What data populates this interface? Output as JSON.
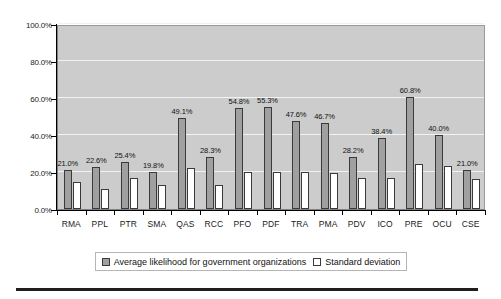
{
  "chart_data": {
    "type": "bar",
    "title": "",
    "xlabel": "",
    "ylabel": "",
    "ylim": [
      0,
      100
    ],
    "yticks": [
      "0.0%",
      "20.0%",
      "40.0%",
      "60.0%",
      "80.0%",
      "100.0%"
    ],
    "ytick_values": [
      0,
      20,
      40,
      60,
      80,
      100
    ],
    "grid": true,
    "legend_position": "bottom",
    "categories": [
      "RMA",
      "PPL",
      "PTR",
      "SMA",
      "QAS",
      "RCC",
      "PFO",
      "PDF",
      "TRA",
      "PMA",
      "PDV",
      "ICO",
      "PRE",
      "OCU",
      "CSE"
    ],
    "series": [
      {
        "name": "Average likelihood for government organizations",
        "color": "#a0a0a0",
        "values": [
          21.0,
          22.6,
          25.4,
          19.8,
          49.1,
          28.3,
          54.8,
          55.3,
          47.6,
          46.7,
          28.2,
          38.4,
          60.8,
          40.0,
          21.0
        ],
        "labels": [
          "21.0%",
          "22.6%",
          "25.4%",
          "19.8%",
          "49.1%",
          "28.3%",
          "54.8%",
          "55.3%",
          "47.6%",
          "46.7%",
          "28.2%",
          "38.4%",
          "60.8%",
          "40.0%",
          "21.0%"
        ]
      },
      {
        "name": "Standard deviation",
        "color": "#ffffff",
        "values": [
          14.6,
          10.8,
          16.5,
          12.8,
          22.0,
          12.8,
          19.8,
          19.8,
          19.8,
          19.5,
          17.0,
          17.0,
          24.6,
          23.0,
          16.3
        ],
        "labels": []
      }
    ]
  },
  "legend": {
    "items": [
      {
        "label": "Average likelihood for government organizations",
        "swatch": "main"
      },
      {
        "label": "Standard deviation",
        "swatch": "sd"
      }
    ]
  },
  "colors": {
    "plot_background": "#cccccc",
    "gridline": "#f2f2f2",
    "series_main": "#a0a0a0",
    "series_sd": "#ffffff",
    "axis": "#000000",
    "text": "#1a1a1a"
  }
}
